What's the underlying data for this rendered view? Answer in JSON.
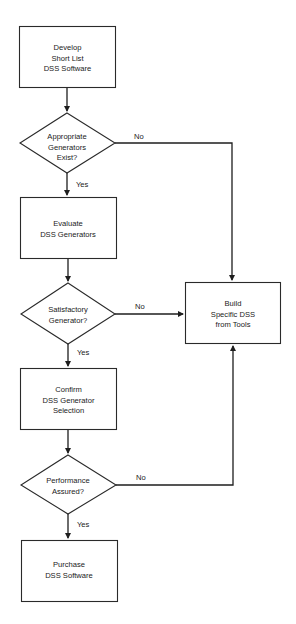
{
  "diagram": {
    "type": "flowchart",
    "nodes": [
      {
        "id": "develop",
        "shape": "process",
        "lines": [
          "Develop",
          "Short List",
          "DSS Software"
        ]
      },
      {
        "id": "appropriate",
        "shape": "decision",
        "lines": [
          "Appropriate",
          "Generators",
          "Exist?"
        ]
      },
      {
        "id": "evaluate",
        "shape": "process",
        "lines": [
          "Evaluate",
          "DSS Generators"
        ]
      },
      {
        "id": "satisfactory",
        "shape": "decision",
        "lines": [
          "Satisfactory",
          "Generator?"
        ]
      },
      {
        "id": "confirm",
        "shape": "process",
        "lines": [
          "Confirm",
          "DSS Generator",
          "Selection"
        ]
      },
      {
        "id": "performance",
        "shape": "decision",
        "lines": [
          "Performance",
          "Assured?"
        ]
      },
      {
        "id": "purchase",
        "shape": "process",
        "lines": [
          "Purchase",
          "DSS Software"
        ]
      },
      {
        "id": "build",
        "shape": "process",
        "lines": [
          "Build",
          "Specific DSS",
          "from Tools"
        ]
      }
    ],
    "edges": [
      {
        "from": "develop",
        "to": "appropriate",
        "label": ""
      },
      {
        "from": "appropriate",
        "to": "evaluate",
        "label": "Yes"
      },
      {
        "from": "appropriate",
        "to": "build",
        "label": "No"
      },
      {
        "from": "evaluate",
        "to": "satisfactory",
        "label": ""
      },
      {
        "from": "satisfactory",
        "to": "confirm",
        "label": "Yes"
      },
      {
        "from": "satisfactory",
        "to": "build",
        "label": "No"
      },
      {
        "from": "confirm",
        "to": "performance",
        "label": ""
      },
      {
        "from": "performance",
        "to": "purchase",
        "label": "Yes"
      },
      {
        "from": "performance",
        "to": "build",
        "label": "No"
      }
    ],
    "labels": {
      "yes": "Yes",
      "no": "No"
    }
  }
}
